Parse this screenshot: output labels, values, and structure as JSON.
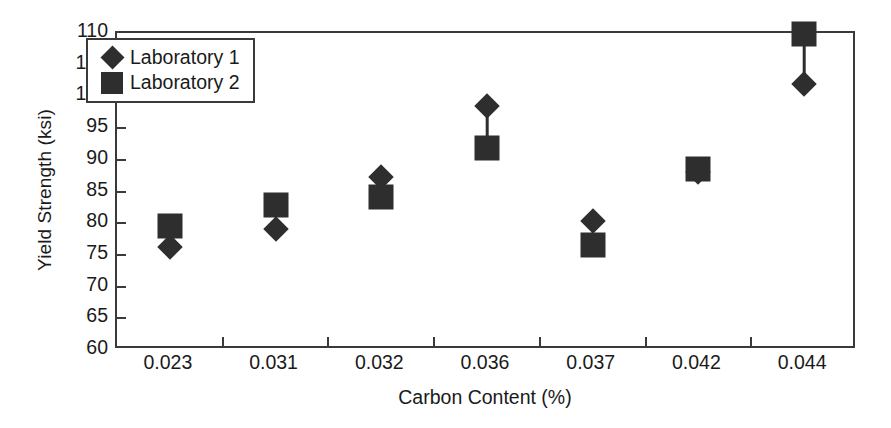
{
  "chart_data": {
    "type": "scatter",
    "title": "",
    "xlabel": "Carbon Content (%)",
    "ylabel": "Yield Strength (ksi)",
    "categories": [
      "0.023",
      "0.031",
      "0.032",
      "0.036",
      "0.037",
      "0.042",
      "0.044"
    ],
    "ylim": [
      60,
      110
    ],
    "ytick_labels": [
      "60",
      "65",
      "70",
      "75",
      "80",
      "85",
      "90",
      "95",
      "100",
      "105",
      "110"
    ],
    "ytick_values": [
      60,
      65,
      70,
      75,
      80,
      85,
      90,
      95,
      100,
      105,
      110
    ],
    "grid": false,
    "legend_position": "upper-left-inside",
    "series": [
      {
        "name": "Laboratory 1",
        "marker": "diamond",
        "color": "#2e2e2e",
        "values": [
          76.2,
          79.1,
          87.3,
          98.5,
          80.3,
          88.0,
          102.0
        ]
      },
      {
        "name": "Laboratory 2",
        "marker": "square",
        "color": "#2e2e2e",
        "values": [
          79.5,
          82.8,
          84.1,
          91.8,
          76.6,
          88.6,
          109.8
        ]
      }
    ],
    "annotations": "Each carbon-content category shows the paired Laboratory 1 and Laboratory 2 readings joined by a short vertical connector line."
  },
  "legend": {
    "entries": [
      {
        "label": "Laboratory 1",
        "marker": "diamond"
      },
      {
        "label": "Laboratory 2",
        "marker": "square"
      }
    ]
  },
  "colors": {
    "marker": "#2e2e2e",
    "axis": "#3a3a3a",
    "text": "#1a1a1a",
    "background": "#ffffff"
  }
}
